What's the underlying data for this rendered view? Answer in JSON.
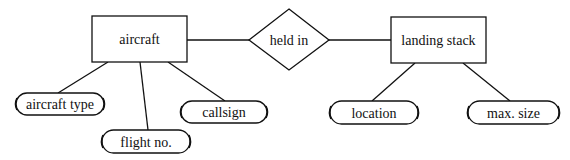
{
  "diagram": {
    "type": "entity-relationship",
    "entities": [
      {
        "id": "aircraft",
        "label": "aircraft"
      },
      {
        "id": "landing_stack",
        "label": "landing stack"
      }
    ],
    "relationships": [
      {
        "id": "held_in",
        "label": "held in",
        "from": "aircraft",
        "to": "landing_stack"
      }
    ],
    "attributes": [
      {
        "id": "aircraft_type",
        "label": "aircraft type",
        "of": "aircraft"
      },
      {
        "id": "flight_no",
        "label": "flight no.",
        "of": "aircraft"
      },
      {
        "id": "callsign",
        "label": "callsign",
        "of": "aircraft"
      },
      {
        "id": "location",
        "label": "location",
        "of": "landing_stack"
      },
      {
        "id": "max_size",
        "label": "max. size",
        "of": "landing_stack"
      }
    ],
    "colors": {
      "stroke": "#111111",
      "fill": "#ffffff",
      "text": "#111111"
    }
  }
}
